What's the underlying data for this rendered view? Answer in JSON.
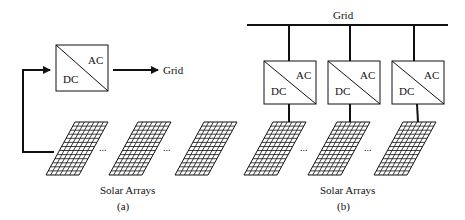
{
  "diagram": {
    "panel_a": {
      "converter": {
        "ac_label": "AC",
        "dc_label": "DC"
      },
      "grid_label": "Grid",
      "arrays_label": "Solar Arrays",
      "caption": "(a)",
      "ellipsis": "..."
    },
    "panel_b": {
      "grid_label": "Grid",
      "converters": [
        {
          "ac_label": "AC",
          "dc_label": "DC"
        },
        {
          "ac_label": "AC",
          "dc_label": "DC"
        },
        {
          "ac_label": "AC",
          "dc_label": "DC"
        }
      ],
      "arrays_label": "Solar Arrays",
      "caption": "(b)",
      "ellipsis": "..."
    },
    "colors": {
      "stroke": "#111111",
      "background": "#ffffff"
    }
  }
}
